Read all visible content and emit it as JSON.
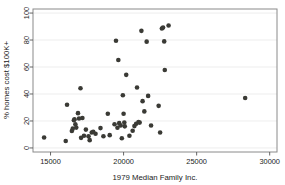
{
  "chart_data": {
    "type": "scatter",
    "title": "",
    "xlabel": "1979 Median Family Inc.",
    "ylabel": "% homes cost $100K+",
    "xlim": [
      13800,
      30500
    ],
    "ylim": [
      -3,
      103
    ],
    "xticks": [
      15000,
      20000,
      25000,
      30000
    ],
    "xtick_labels": [
      "15000",
      "20000",
      "25000",
      "30000"
    ],
    "yticks": [
      0,
      20,
      40,
      60,
      80,
      100
    ],
    "ytick_labels": [
      "0",
      "20",
      "40",
      "60",
      "80",
      "100"
    ],
    "grid": "horizontal",
    "legend": "none",
    "marker": {
      "shape": "circle",
      "color": "#3a3a35",
      "size": 4.6
    },
    "frame": true,
    "points": [
      {
        "x": 14560,
        "y": 7.7
      },
      {
        "x": 16040,
        "y": 5.2
      },
      {
        "x": 16130,
        "y": 32.0
      },
      {
        "x": 16460,
        "y": 12.6
      },
      {
        "x": 16520,
        "y": 14.3
      },
      {
        "x": 16600,
        "y": 20.5
      },
      {
        "x": 16640,
        "y": 21.3
      },
      {
        "x": 16700,
        "y": 17.6
      },
      {
        "x": 16760,
        "y": 15.1
      },
      {
        "x": 16880,
        "y": 25.8
      },
      {
        "x": 16950,
        "y": 21.8
      },
      {
        "x": 17050,
        "y": 44.2
      },
      {
        "x": 17090,
        "y": 7.5
      },
      {
        "x": 17180,
        "y": 22.2
      },
      {
        "x": 17290,
        "y": 9.0
      },
      {
        "x": 17420,
        "y": 13.6
      },
      {
        "x": 17600,
        "y": 8.6
      },
      {
        "x": 17680,
        "y": 5.8
      },
      {
        "x": 17820,
        "y": 11.5
      },
      {
        "x": 17920,
        "y": 12.0
      },
      {
        "x": 18080,
        "y": 10.5
      },
      {
        "x": 18420,
        "y": 14.7
      },
      {
        "x": 18620,
        "y": 8.7
      },
      {
        "x": 18920,
        "y": 25.4
      },
      {
        "x": 19050,
        "y": 9.5
      },
      {
        "x": 19380,
        "y": 17.6
      },
      {
        "x": 19480,
        "y": 79.5
      },
      {
        "x": 19580,
        "y": 15.0
      },
      {
        "x": 19640,
        "y": 65.2
      },
      {
        "x": 19700,
        "y": 18.4
      },
      {
        "x": 19800,
        "y": 16.6
      },
      {
        "x": 19880,
        "y": 7.2
      },
      {
        "x": 19950,
        "y": 39.1
      },
      {
        "x": 20000,
        "y": 25.4
      },
      {
        "x": 20050,
        "y": 18.8
      },
      {
        "x": 20080,
        "y": 16.0
      },
      {
        "x": 20180,
        "y": 54.2
      },
      {
        "x": 20400,
        "y": 9.0
      },
      {
        "x": 20620,
        "y": 12.8
      },
      {
        "x": 20740,
        "y": 16.2
      },
      {
        "x": 20860,
        "y": 17.9
      },
      {
        "x": 20920,
        "y": 44.8
      },
      {
        "x": 21020,
        "y": 19.2
      },
      {
        "x": 21100,
        "y": 18.8
      },
      {
        "x": 21220,
        "y": 86.8
      },
      {
        "x": 21300,
        "y": 34.7
      },
      {
        "x": 21420,
        "y": 27.1
      },
      {
        "x": 21580,
        "y": 78.8
      },
      {
        "x": 21680,
        "y": 38.6
      },
      {
        "x": 21880,
        "y": 16.6
      },
      {
        "x": 22400,
        "y": 31.2
      },
      {
        "x": 22500,
        "y": 11.4
      },
      {
        "x": 22620,
        "y": 88.6
      },
      {
        "x": 22700,
        "y": 89.2
      },
      {
        "x": 22780,
        "y": 79.0
      },
      {
        "x": 22820,
        "y": 57.8
      },
      {
        "x": 23080,
        "y": 90.8
      },
      {
        "x": 28320,
        "y": 37.0
      }
    ]
  }
}
